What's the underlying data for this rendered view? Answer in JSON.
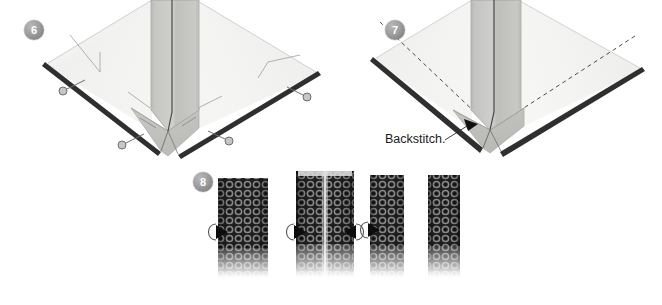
{
  "page": {
    "background_color": "#ffffff",
    "width": 662,
    "height": 305
  },
  "palette": {
    "fabric_light": "#f0f0ef",
    "fabric_light_2": "#e8e8e6",
    "fabric_mid": "#c9c9c6",
    "fabric_mid_2": "#bdbdba",
    "fabric_dark_edge": "#2b2b2b",
    "line_dark": "#3a3a3a",
    "badge_gray": "#8f8f8f",
    "badge_text": "#ffffff",
    "text_color": "#1a1a1a",
    "strip_dark": "#232323",
    "strip_ring": "#6e6e6e",
    "strip_seam": "#cfcfcf"
  },
  "steps": [
    {
      "id": "step-6",
      "number": "6",
      "badge_x": 24,
      "badge_y": 20,
      "labels": [],
      "pins": [
        {
          "name": "pin-upper-left",
          "head_x": 63,
          "head_y": 90,
          "tail_x": 83,
          "tail_y": 80
        },
        {
          "name": "pin-lower-left",
          "head_x": 122,
          "head_y": 144,
          "tail_x": 142,
          "tail_y": 134
        },
        {
          "name": "pin-lower-right",
          "head_x": 229,
          "head_y": 140,
          "tail_x": 210,
          "tail_y": 130
        },
        {
          "name": "pin-upper-right",
          "head_x": 307,
          "head_y": 96,
          "tail_x": 288,
          "tail_y": 86
        }
      ]
    },
    {
      "id": "step-7",
      "number": "7",
      "badge_x": 385,
      "badge_y": 20,
      "labels": [
        {
          "name": "backstitch-label",
          "text": "Backstitch.",
          "x": 385,
          "y": 133
        }
      ],
      "pins": []
    },
    {
      "id": "step-8",
      "number": "8",
      "badge_x": 193,
      "badge_y": 172,
      "labels": [],
      "pins": []
    }
  ],
  "strips": [
    {
      "name": "strip-1",
      "x": 218,
      "y": 178,
      "width": 50,
      "height": 100,
      "seam": false,
      "arrows": [
        "left"
      ]
    },
    {
      "name": "strip-2",
      "x": 296,
      "y": 171,
      "width": 58,
      "height": 107,
      "seam": true,
      "arrows": [
        "left",
        "right"
      ]
    },
    {
      "name": "strip-3",
      "x": 370,
      "y": 175,
      "width": 34,
      "height": 103,
      "seam": false,
      "arrows": [
        "left"
      ]
    },
    {
      "name": "strip-4",
      "x": 428,
      "y": 175,
      "width": 32,
      "height": 103,
      "seam": false,
      "arrows": []
    }
  ],
  "icons": {
    "pin": "pin-icon",
    "arrowhead": "arrowhead-icon",
    "fold-arrow": "fold-arrow-icon"
  }
}
